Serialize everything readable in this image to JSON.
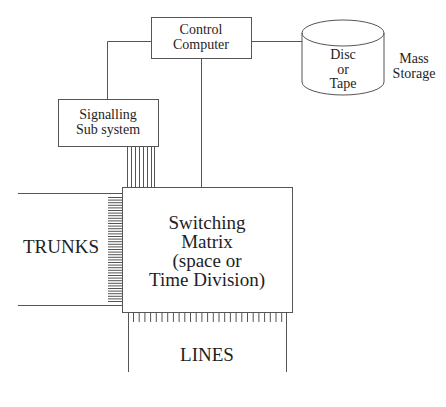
{
  "diagram": {
    "control_computer": {
      "line1": "Control",
      "line2": "Computer"
    },
    "signalling": {
      "line1": "Signalling",
      "line2": "Sub system"
    },
    "storage": {
      "line1": "Disc",
      "line2": "or",
      "line3": "Tape"
    },
    "mass_storage": {
      "line1": "Mass",
      "line2": "Storage"
    },
    "switching_matrix": {
      "line1": "Switching",
      "line2": "Matrix",
      "line3": "(space or",
      "line4": "Time Division)"
    },
    "trunks": {
      "label": "TRUNKS"
    },
    "lines": {
      "label": "LINES"
    },
    "colors": {
      "stroke": "#555555",
      "text": "#1e1e1e",
      "background": "#ffffff"
    }
  }
}
